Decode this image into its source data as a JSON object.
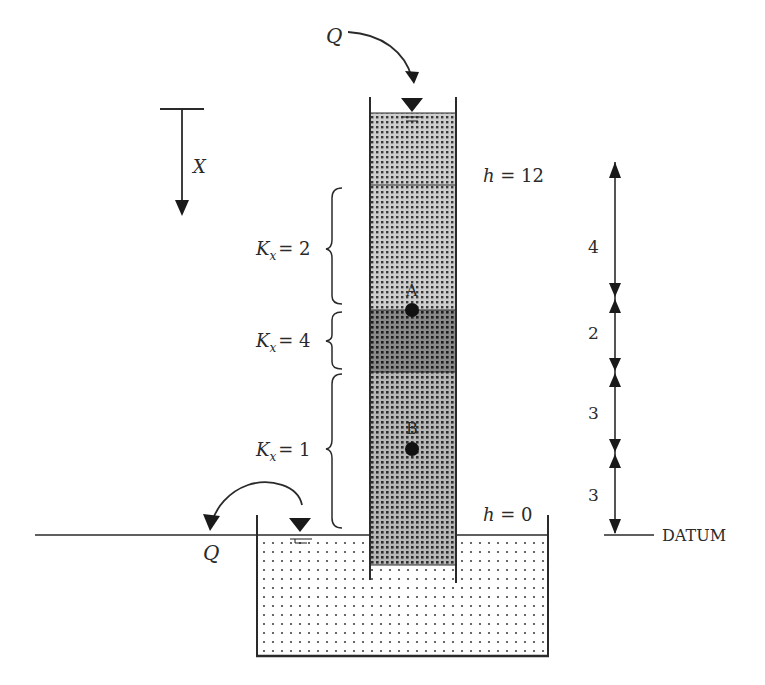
{
  "diagram": {
    "inflow": {
      "label": "Q"
    },
    "outflow": {
      "label": "Q"
    },
    "axis": {
      "label": "X"
    },
    "heads": {
      "top": "h = 12",
      "bottom": "h = 0"
    },
    "layers": [
      {
        "label_k": "K",
        "label_sub": "x",
        "label_val": "= 2",
        "thickness": "4"
      },
      {
        "label_k": "K",
        "label_sub": "x",
        "label_val": "= 4",
        "thickness": "2"
      },
      {
        "label_k": "K",
        "label_sub": "x",
        "label_val": "= 1",
        "thickness": "3"
      }
    ],
    "points": {
      "a": "A",
      "b": "B"
    },
    "dimensions": [
      "4",
      "2",
      "3",
      "3"
    ],
    "datum": "DATUM",
    "colors": {
      "line": "#2a2a2a",
      "sand_light": "#bdbdbd",
      "sand_dark": "#7a7a7a",
      "sand_mid": "#a6a6a6",
      "water": "#ffffff"
    }
  }
}
